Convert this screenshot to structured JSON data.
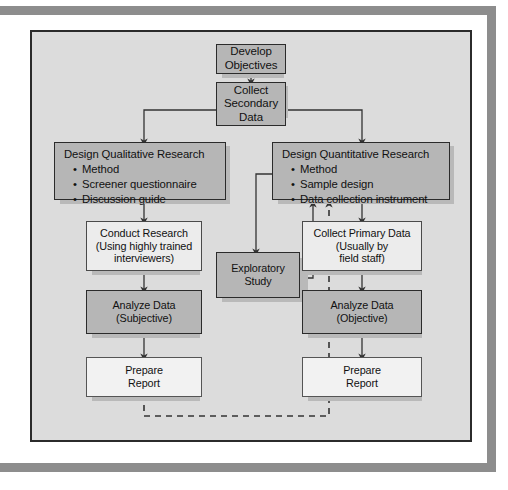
{
  "diagram": {
    "colors": {
      "panel_bg": "#dcdcdc",
      "box_dark": "#b6b6b6",
      "box_light": "#ececec",
      "box_vlight": "#f2f2f2",
      "line": "#333333",
      "frame": "#8d8d8d"
    },
    "nodes": {
      "develop_objectives": {
        "lines": [
          "Develop",
          "Objectives"
        ]
      },
      "collect_secondary_data": {
        "lines": [
          "Collect",
          "Secondary",
          "Data"
        ]
      },
      "design_qualitative": {
        "title": "Design Qualitative Research",
        "bullets": [
          "Method",
          "Screener questionnaire",
          "Discussion guide"
        ]
      },
      "design_quantitative": {
        "title": "Design Quantitative Research",
        "bullets": [
          "Method",
          "Sample design",
          "Data collection instrument"
        ]
      },
      "conduct_research": {
        "lines": [
          "Conduct Research",
          "(Using highly trained",
          "interviewers)"
        ]
      },
      "collect_primary_data": {
        "lines": [
          "Collect Primary Data",
          "(Usually by",
          "field staff)"
        ]
      },
      "exploratory_study": {
        "lines": [
          "Exploratory",
          "Study"
        ]
      },
      "analyze_data_subjective": {
        "lines": [
          "Analyze Data",
          "(Subjective)"
        ]
      },
      "analyze_data_objective": {
        "lines": [
          "Analyze Data",
          "(Objective)"
        ]
      },
      "prepare_report_left": {
        "lines": [
          "Prepare",
          "Report"
        ]
      },
      "prepare_report_right": {
        "lines": [
          "Prepare",
          "Report"
        ]
      }
    },
    "edges": [
      {
        "from": "develop_objectives",
        "to": "collect_secondary_data",
        "style": "solid"
      },
      {
        "from": "collect_secondary_data",
        "to": "design_qualitative",
        "style": "solid"
      },
      {
        "from": "collect_secondary_data",
        "to": "design_quantitative",
        "style": "solid"
      },
      {
        "from": "design_qualitative",
        "to": "conduct_research",
        "style": "solid"
      },
      {
        "from": "conduct_research",
        "to": "analyze_data_subjective",
        "style": "solid"
      },
      {
        "from": "analyze_data_subjective",
        "to": "prepare_report_left",
        "style": "solid"
      },
      {
        "from": "design_quantitative",
        "to": "exploratory_study",
        "style": "solid"
      },
      {
        "from": "exploratory_study",
        "to": "design_quantitative",
        "style": "solid"
      },
      {
        "from": "design_quantitative",
        "to": "collect_primary_data",
        "style": "solid"
      },
      {
        "from": "collect_primary_data",
        "to": "analyze_data_objective",
        "style": "solid"
      },
      {
        "from": "analyze_data_objective",
        "to": "prepare_report_right",
        "style": "solid"
      },
      {
        "from": "prepare_report_left",
        "to": "design_quantitative",
        "style": "dashed"
      }
    ]
  }
}
